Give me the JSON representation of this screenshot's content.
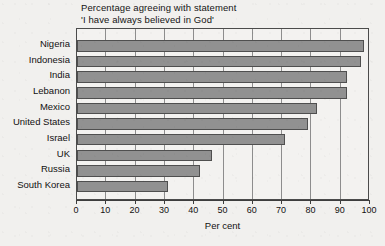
{
  "chart_data": {
    "type": "bar",
    "orientation": "horizontal",
    "title": "Percentage agreeing with statement",
    "subtitle": "'I have always believed in God'",
    "xlabel": "Per cent",
    "ylabel": "",
    "xlim": [
      0,
      100
    ],
    "xticks": [
      "0",
      "10",
      "20",
      "30",
      "40",
      "50",
      "60",
      "70",
      "80",
      "90",
      "100"
    ],
    "grid": "vertical",
    "legend": "none",
    "categories": [
      "Nigeria",
      "Indonesia",
      "India",
      "Lebanon",
      "Mexico",
      "United States",
      "Israel",
      "UK",
      "Russia",
      "South Korea"
    ],
    "values": [
      98,
      97,
      92,
      92,
      82,
      79,
      71,
      46,
      42,
      31
    ],
    "colors": {
      "bar_fill": "#919191",
      "bar_edge": "#4f4f4f",
      "plot_background": "#f3f2f0",
      "page_background": "#f1f0ee",
      "grid": "#8d8d8d",
      "axis": "#3d3d3d",
      "text": "#111111"
    }
  }
}
